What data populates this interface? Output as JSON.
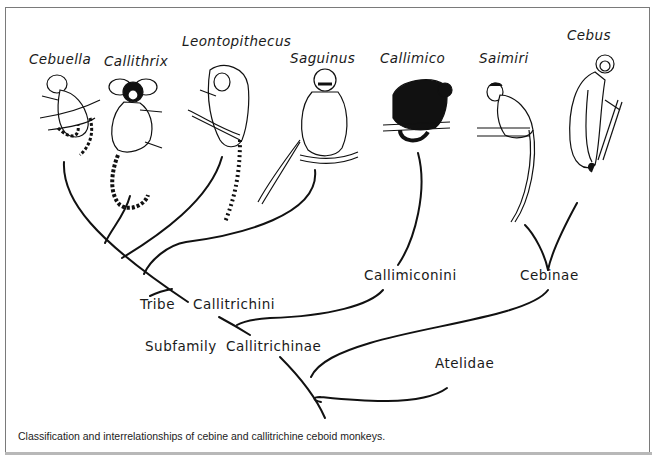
{
  "figure": {
    "caption": "Classification and interrelationships of cebine and callitrichine ceboid monkeys.",
    "ink_color": "#111111",
    "frame_color": "#7a7a7a"
  },
  "genera": [
    {
      "id": "cebuella",
      "label": "Cebuella"
    },
    {
      "id": "callithrix",
      "label": "Callithrix"
    },
    {
      "id": "leontopithecus",
      "label": "Leontopithecus"
    },
    {
      "id": "saguinus",
      "label": "Saguinus"
    },
    {
      "id": "callimico",
      "label": "Callimico"
    },
    {
      "id": "saimiri",
      "label": "Saimiri"
    },
    {
      "id": "cebus",
      "label": "Cebus"
    }
  ],
  "taxa": {
    "tribe_prefix": "Tribe",
    "tribe_name": "Callitrichini",
    "callimiconini": "Callimiconini",
    "subfamily_prefix": "Subfamily",
    "subfamily_name": "Callitrichinae",
    "cebinae": "Cebinae",
    "atelidae": "Atelidae"
  },
  "tree": {
    "relationships": [
      {
        "clade": "Callitrichini",
        "members": [
          "Cebuella",
          "Callithrix",
          "Leontopithecus",
          "Saguinus"
        ]
      },
      {
        "clade": "Callitrichinae",
        "members": [
          "Callitrichini",
          "Callimiconini"
        ]
      },
      {
        "clade": "Callimiconini",
        "members": [
          "Callimico"
        ]
      },
      {
        "clade": "Cebinae",
        "members": [
          "Saimiri",
          "Cebus"
        ]
      },
      {
        "clade": "root",
        "members": [
          "Callitrichinae",
          "Cebinae",
          "Atelidae"
        ]
      }
    ]
  }
}
